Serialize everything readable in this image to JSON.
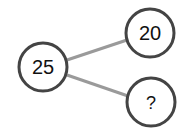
{
  "diagram": {
    "type": "number-bond",
    "colors": {
      "node_stroke": "#444444",
      "edge": "#9a9a9a",
      "text": "#111111",
      "background": "#ffffff"
    },
    "nodes": [
      {
        "id": "whole",
        "label": "25",
        "cx": 43,
        "cy": 67,
        "r": 24
      },
      {
        "id": "part-1",
        "label": "20",
        "cx": 150,
        "cy": 33,
        "r": 24
      },
      {
        "id": "part-2",
        "label": "?",
        "cx": 151,
        "cy": 102,
        "r": 24
      }
    ],
    "edges": [
      {
        "from": "whole",
        "to": "part-1"
      },
      {
        "from": "whole",
        "to": "part-2"
      }
    ]
  }
}
